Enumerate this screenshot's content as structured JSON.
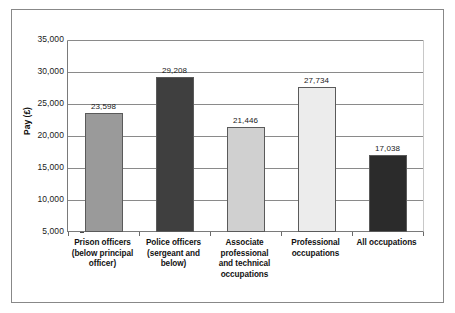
{
  "chart_data": {
    "type": "bar",
    "title": "",
    "subtitle": "",
    "xlabel": "",
    "ylabel": "Pay (£)",
    "ylim": [
      5000,
      35000
    ],
    "ytick_values": [
      5000,
      10000,
      15000,
      20000,
      25000,
      30000,
      35000
    ],
    "ytick_labels": [
      "5,000",
      "10,000",
      "15,000",
      "20,000",
      "25,000",
      "30,000",
      "35,000"
    ],
    "grid": true,
    "legend": "none",
    "categories": [
      "Prison officers (below principal officer)",
      "Police officers (sergeant and below)",
      "Associate professional and technical occupations",
      "Professional occupations",
      "All occupations"
    ],
    "category_lines": [
      [
        "Prison officers",
        "(below principal",
        "officer)"
      ],
      [
        "Police officers",
        "(sergeant and",
        "below)"
      ],
      [
        "Associate",
        "professional",
        "and technical",
        "occupations"
      ],
      [
        "Professional",
        "occupations"
      ],
      [
        "All occupations"
      ]
    ],
    "values": [
      23598,
      29208,
      21446,
      27734,
      17038
    ],
    "value_labels": [
      "23,598",
      "29,208",
      "21,446",
      "27,734",
      "17,038"
    ],
    "bar_colors": [
      "#9a9a9a",
      "#3f3f3f",
      "#d0d0d0",
      "#ececec",
      "#2b2b2b"
    ]
  }
}
